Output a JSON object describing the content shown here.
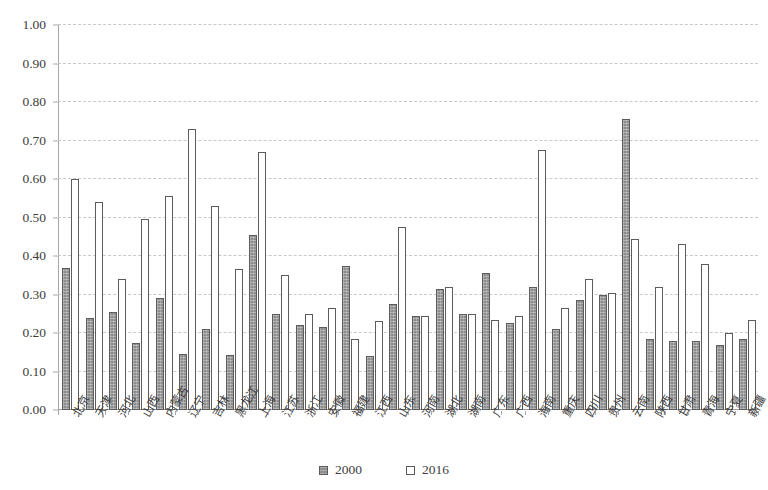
{
  "chart_data": {
    "type": "bar",
    "title": "",
    "xlabel": "",
    "ylabel": "",
    "ylim": [
      0.0,
      1.0
    ],
    "ytick_step": 0.1,
    "grid": true,
    "legend_position": "bottom-center",
    "categories": [
      "北京",
      "天津",
      "河北",
      "山西",
      "内蒙古",
      "辽宁",
      "吉林",
      "黑龙江",
      "上海",
      "江苏",
      "浙江",
      "安徽",
      "福建",
      "江西",
      "山东",
      "河南",
      "湖北",
      "湖南",
      "广东",
      "广西",
      "海南",
      "重庆",
      "四川",
      "贵州",
      "云南",
      "陕西",
      "甘肃",
      "青海",
      "宁夏",
      "新疆"
    ],
    "tick_labels": [
      "0.00",
      "0.10",
      "0.20",
      "0.30",
      "0.40",
      "0.50",
      "0.60",
      "0.70",
      "0.80",
      "0.90",
      "1.00"
    ],
    "series": [
      {
        "name": "2000",
        "values": [
          0.37,
          0.24,
          0.255,
          0.175,
          0.29,
          0.145,
          0.21,
          0.143,
          0.455,
          0.25,
          0.22,
          0.215,
          0.375,
          0.14,
          0.275,
          0.245,
          0.315,
          0.25,
          0.355,
          0.225,
          0.32,
          0.21,
          0.285,
          0.3,
          0.755,
          0.185,
          0.18,
          0.18,
          0.17,
          0.185
        ]
      },
      {
        "name": "2016",
        "values": [
          0.6,
          0.54,
          0.34,
          0.495,
          0.555,
          0.73,
          0.53,
          0.365,
          0.67,
          0.35,
          0.25,
          0.265,
          0.185,
          0.23,
          0.475,
          0.245,
          0.32,
          0.25,
          0.235,
          0.245,
          0.675,
          0.265,
          0.34,
          0.305,
          0.445,
          0.32,
          0.43,
          0.38,
          0.2,
          0.235
        ]
      }
    ]
  },
  "legend": {
    "items": [
      {
        "label": "2000",
        "marker": "filled-square-swatch"
      },
      {
        "label": "2016",
        "marker": "hollow-square-swatch"
      }
    ]
  },
  "colors": {
    "series_2000_fill": "#8d8d8d",
    "series_2016_fill": "#ffffff",
    "bar_outline": "#5c5c5c",
    "gridline": "#c9c9c9",
    "axis": "#a8a8a8",
    "text": "#3d3d3d",
    "background": "#ffffff"
  }
}
